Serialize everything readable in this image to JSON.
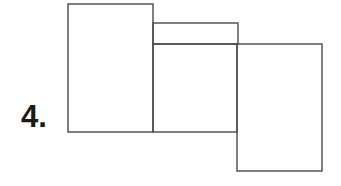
{
  "diagram": {
    "label": "4.",
    "stroke_color": "#4a4a4a",
    "shapes": [
      {
        "name": "left-rectangle",
        "x": 68,
        "y": 4,
        "w": 85,
        "h": 128
      },
      {
        "name": "middle-top-strip",
        "x": 153,
        "y": 23,
        "w": 85,
        "h": 21
      },
      {
        "name": "middle-rectangle",
        "x": 153,
        "y": 44,
        "w": 84,
        "h": 88
      },
      {
        "name": "right-rectangle",
        "x": 237,
        "y": 44,
        "w": 85,
        "h": 127
      }
    ]
  }
}
